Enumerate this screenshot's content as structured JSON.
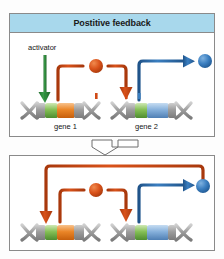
{
  "diagram": {
    "panels": [
      {
        "id": "top",
        "title": "Postitive feedback",
        "labels": {
          "activator": "activator",
          "gene1": "gene 1",
          "gene2": "gene 2"
        }
      },
      {
        "id": "bottom",
        "title": "",
        "labels": {}
      }
    ],
    "icons": {
      "activator_arrow": "green-down-arrow-icon",
      "product1": "red-protein-circle-icon",
      "product2": "blue-protein-circle-icon",
      "gene1_strand": "dna-strand-icon",
      "gene2_strand": "dna-strand-icon",
      "panel_connector": "double-chevron-down-icon"
    },
    "colors": {
      "title_background": "#a8d8ec",
      "panel_border": "#8a8a8a",
      "activator_green": "#2e8b3d",
      "product_red": "#d04a16",
      "product_blue": "#3a7ec0",
      "gene_segment_green": "#7ab648",
      "gene_segment_orange": "#e8811f",
      "gene_segment_blue": "#7fa9d8",
      "dna_gray": "#9a9a9a",
      "background": "#ffffff"
    },
    "flow": {
      "top_panel_steps": [
        "activator activates gene 1",
        "gene 1 produces red product",
        "red product activates gene 2",
        "gene 2 produces blue product"
      ],
      "bottom_panel_steps": [
        "activator activates gene 1",
        "gene 1 produces red product",
        "red product activates gene 2",
        "gene 2 produces blue product",
        "blue product loops back and activates gene 1"
      ]
    }
  }
}
